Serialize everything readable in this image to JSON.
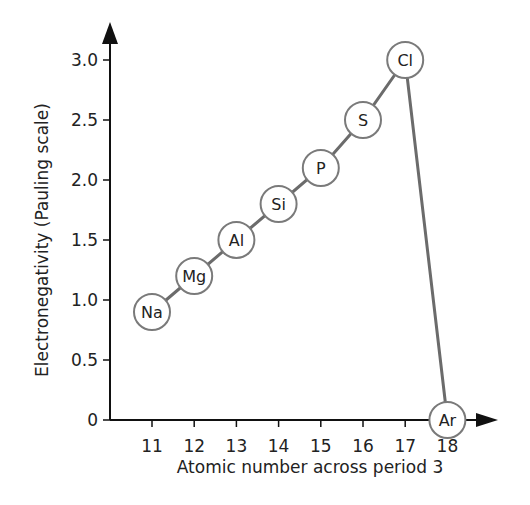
{
  "chart_data": {
    "type": "line",
    "title": "",
    "xlabel": "Atomic number across period 3",
    "ylabel": "Electronegativity (Pauling scale)",
    "x": [
      11,
      12,
      13,
      14,
      15,
      16,
      17,
      18
    ],
    "categories": [
      "Na",
      "Mg",
      "Al",
      "Si",
      "P",
      "S",
      "Cl",
      "Ar"
    ],
    "series": [
      {
        "name": "Electronegativity",
        "labels": [
          "Na",
          "Mg",
          "Al",
          "Si",
          "P",
          "S",
          "Cl",
          "Ar"
        ],
        "values": [
          0.9,
          1.2,
          1.5,
          1.8,
          2.1,
          2.5,
          3.0,
          0
        ]
      }
    ],
    "x_ticks": [
      "11",
      "12",
      "13",
      "14",
      "15",
      "16",
      "17",
      "18"
    ],
    "y_ticks": [
      "0",
      "0.5",
      "1.0",
      "1.5",
      "2.0",
      "2.5",
      "3.0"
    ],
    "y_tick_values": [
      0,
      0.5,
      1.0,
      1.5,
      2.0,
      2.5,
      3.0
    ],
    "ylim": [
      0,
      3.3
    ],
    "xlim": [
      10,
      19
    ],
    "grid": false,
    "legend": "none",
    "colors": {
      "line": "#6b6b6b",
      "axis": "#111111",
      "marker_stroke": "#7a7a7a",
      "marker_fill": "#ffffff"
    }
  }
}
